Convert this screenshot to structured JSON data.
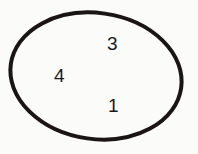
{
  "diagram": {
    "shape": "ellipse",
    "stroke_color": "#1a1414",
    "background": "#fbfbf9",
    "elements": [
      {
        "label": "3",
        "x": 113,
        "y": 50
      },
      {
        "label": "4",
        "x": 60,
        "y": 82
      },
      {
        "label": "1",
        "x": 113,
        "y": 112
      }
    ]
  }
}
